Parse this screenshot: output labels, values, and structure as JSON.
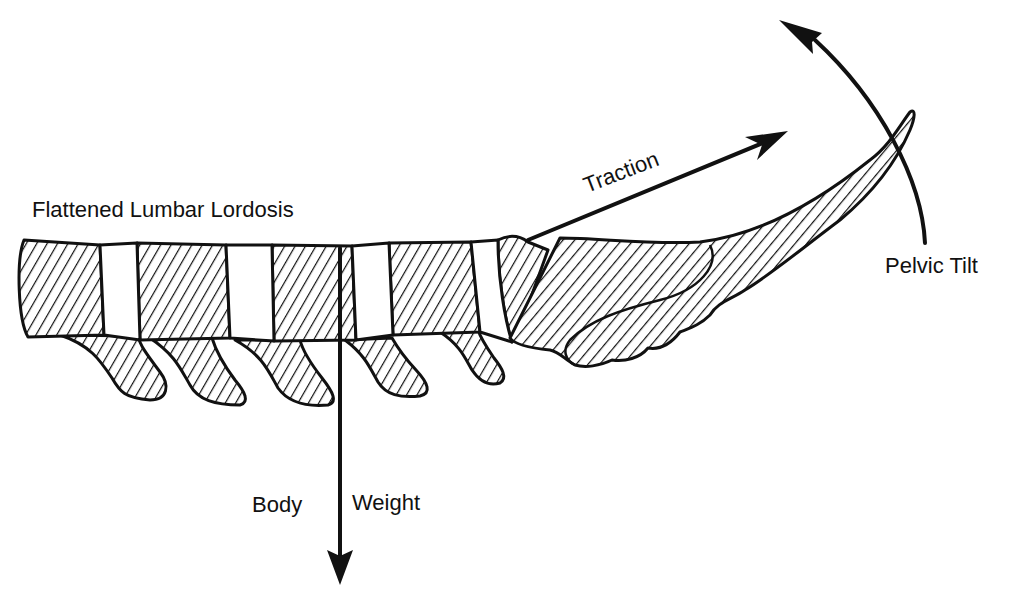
{
  "diagram": {
    "title": "Flattened Lumbar Lordosis",
    "labels": {
      "lordosis": "Flattened Lumbar Lordosis",
      "traction": "Traction",
      "pelvic_tilt": "Pelvic Tilt",
      "body": "Body",
      "weight": "Weight"
    },
    "elements": {
      "vertebrae_count": 5,
      "discs_count": 5,
      "structures": [
        "lumbar vertebrae",
        "intervertebral discs",
        "spinous processes",
        "sacrum",
        "coccyx"
      ],
      "forces": [
        "Traction",
        "Pelvic Tilt",
        "Body Weight"
      ]
    },
    "colors": {
      "ink": "#111111",
      "background": "#ffffff"
    }
  }
}
